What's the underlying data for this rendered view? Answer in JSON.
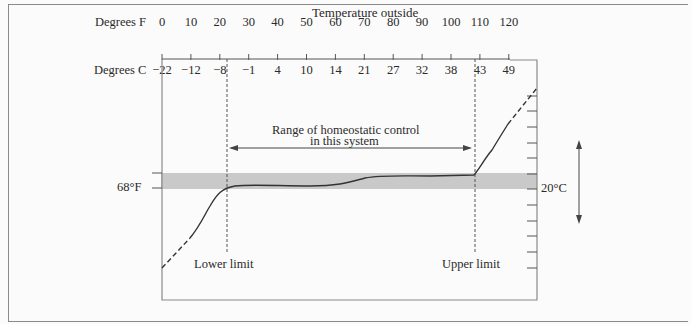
{
  "title": "Temperature outside",
  "axis": {
    "fahrenheit_label": "Degrees F",
    "celsius_label": "Degrees C",
    "fahrenheit_ticks": [
      "0",
      "10",
      "20",
      "30",
      "40",
      "50",
      "60",
      "70",
      "80",
      "90",
      "100",
      "110",
      "120"
    ],
    "celsius_ticks": [
      "−22",
      "−12",
      "−8",
      "−1",
      "4",
      "10",
      "14",
      "21",
      "27",
      "32",
      "38",
      "43",
      "49"
    ]
  },
  "annotations": {
    "range_label_line1": "Range of homeostatic control",
    "range_label_line2": "in this system",
    "lower_limit": "Lower limit",
    "upper_limit": "Upper limit",
    "left_setpoint": "68°F",
    "right_setpoint": "20°C"
  },
  "colors": {
    "band": "#c9c9c9",
    "line": "#333333",
    "frame": "#8a8a8a"
  },
  "chart_data": {
    "type": "line",
    "title": "Temperature outside",
    "xlabel": "Degrees F / Degrees C (outside temperature)",
    "ylabel": "Internal temperature",
    "x_ticks_F": [
      0,
      10,
      20,
      30,
      40,
      50,
      60,
      70,
      80,
      90,
      100,
      110,
      120
    ],
    "x_ticks_C": [
      -22,
      -12,
      -8,
      -1,
      4,
      10,
      14,
      21,
      27,
      32,
      38,
      43,
      49
    ],
    "setpoint": "68°F / 20°C",
    "lower_limit_F": 22,
    "upper_limit_F": 107,
    "series": [
      {
        "name": "Internal temperature (relative)",
        "x_F": [
          0,
          8,
          15,
          22,
          30,
          55,
          65,
          75,
          107,
          112,
          120,
          126
        ],
        "y_rel": [
          -4.5,
          -2.5,
          -1,
          0.1,
          0.3,
          0.3,
          0.8,
          1,
          1,
          3,
          5,
          6
        ]
      }
    ]
  }
}
